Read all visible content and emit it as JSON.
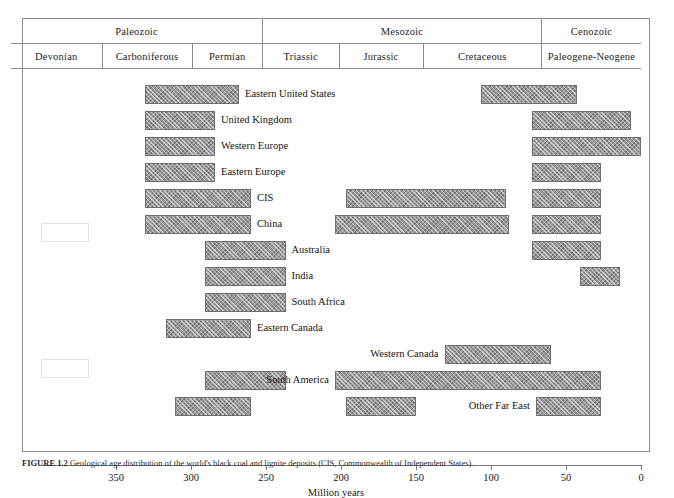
{
  "figure": {
    "axis_title": "Million years",
    "caption_label": "FIGURE 1.2",
    "caption_text": "Geological age distribution of the world's black coal and lignite deposits (CIS, Commonwealth of Independent States)."
  },
  "header": {
    "eras": [
      {
        "name": "Paleozoic",
        "start_ma": 420,
        "end_ma": 252
      },
      {
        "name": "Mesozoic",
        "start_ma": 252,
        "end_ma": 66
      },
      {
        "name": "Cenozoic",
        "start_ma": 66,
        "end_ma": 0
      }
    ],
    "periods": [
      {
        "name": "Devonian",
        "start_ma": 420,
        "end_ma": 359
      },
      {
        "name": "Carboniferous",
        "start_ma": 359,
        "end_ma": 299
      },
      {
        "name": "Permian",
        "start_ma": 299,
        "end_ma": 252
      },
      {
        "name": "Triassic",
        "start_ma": 252,
        "end_ma": 201
      },
      {
        "name": "Jurassic",
        "start_ma": 201,
        "end_ma": 145
      },
      {
        "name": "Cretaceous",
        "start_ma": 145,
        "end_ma": 66
      },
      {
        "name": "Paleogene-Neogene",
        "start_ma": 66,
        "end_ma": 0
      }
    ]
  },
  "chart_data": {
    "type": "bar",
    "xlabel": "Million years",
    "ylabel": "",
    "xlim": [
      400,
      0
    ],
    "x_ticks": [
      350,
      300,
      250,
      200,
      150,
      100,
      50,
      0
    ],
    "x_tick_labels": [
      "350",
      "300",
      "250",
      "200",
      "150",
      "100",
      "50",
      "0"
    ],
    "grid": false,
    "legend": "none",
    "orientation": "horizontal-ranges",
    "rows": [
      {
        "region": "Eastern United States",
        "label_side": "right",
        "bars": [
          {
            "start_ma": 331,
            "end_ma": 268
          },
          {
            "start_ma": 107,
            "end_ma": 43
          }
        ]
      },
      {
        "region": "United Kingdom",
        "label_side": "right",
        "bars": [
          {
            "start_ma": 331,
            "end_ma": 284
          },
          {
            "start_ma": 73,
            "end_ma": 7
          }
        ]
      },
      {
        "region": "Western Europe",
        "label_side": "right",
        "bars": [
          {
            "start_ma": 331,
            "end_ma": 284
          },
          {
            "start_ma": 73,
            "end_ma": 0
          }
        ]
      },
      {
        "region": "Eastern Europe",
        "label_side": "right",
        "bars": [
          {
            "start_ma": 331,
            "end_ma": 284
          },
          {
            "start_ma": 73,
            "end_ma": 27
          }
        ]
      },
      {
        "region": "CIS",
        "label_side": "right",
        "bars": [
          {
            "start_ma": 331,
            "end_ma": 260
          },
          {
            "start_ma": 197,
            "end_ma": 90
          },
          {
            "start_ma": 73,
            "end_ma": 27
          }
        ]
      },
      {
        "region": "China",
        "label_side": "right",
        "bars": [
          {
            "start_ma": 331,
            "end_ma": 260
          },
          {
            "start_ma": 204,
            "end_ma": 88
          },
          {
            "start_ma": 73,
            "end_ma": 27
          }
        ]
      },
      {
        "region": "Australia",
        "label_side": "right",
        "bars": [
          {
            "start_ma": 291,
            "end_ma": 237
          },
          {
            "start_ma": 73,
            "end_ma": 27
          }
        ]
      },
      {
        "region": "India",
        "label_side": "right",
        "bars": [
          {
            "start_ma": 291,
            "end_ma": 237
          },
          {
            "start_ma": 41,
            "end_ma": 14
          }
        ]
      },
      {
        "region": "South Africa",
        "label_side": "right",
        "bars": [
          {
            "start_ma": 291,
            "end_ma": 237
          }
        ]
      },
      {
        "region": "Eastern Canada",
        "label_side": "right",
        "bars": [
          {
            "start_ma": 317,
            "end_ma": 260
          }
        ]
      },
      {
        "region": "Western Canada",
        "label_side": "left",
        "bars": [
          {
            "start_ma": 131,
            "end_ma": 60
          }
        ]
      },
      {
        "region": "South America",
        "label_side": "left",
        "bars": [
          {
            "start_ma": 291,
            "end_ma": 237
          },
          {
            "start_ma": 204,
            "end_ma": 27
          }
        ]
      },
      {
        "region": "Other Far East",
        "label_side": "left",
        "bars": [
          {
            "start_ma": 311,
            "end_ma": 260
          },
          {
            "start_ma": 197,
            "end_ma": 150
          },
          {
            "start_ma": 70,
            "end_ma": 27
          }
        ]
      }
    ]
  }
}
